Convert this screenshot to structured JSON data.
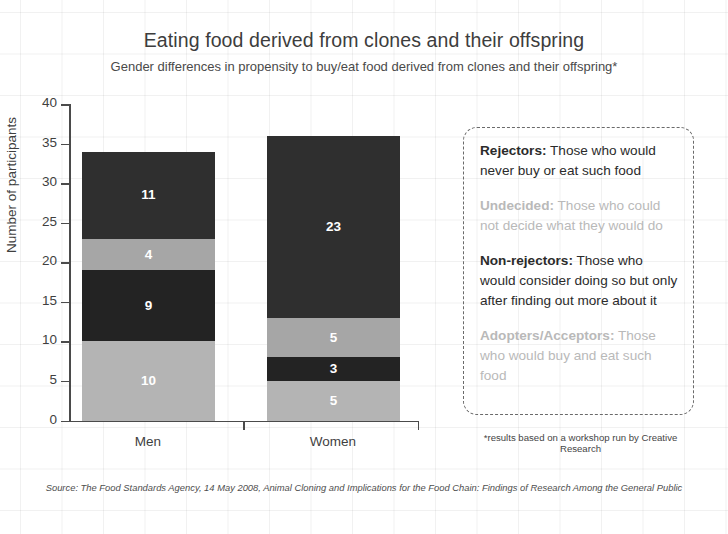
{
  "chart_data": {
    "type": "bar",
    "subtype": "stacked-bar",
    "title": "Eating food derived from clones and their offspring",
    "subtitle": "Gender differences in propensity to buy/eat food derived from clones and their offspring*",
    "xlabel": "",
    "ylabel": "Number of participants",
    "ylim": [
      0,
      40
    ],
    "yticks": [
      0,
      5,
      10,
      15,
      20,
      25,
      30,
      35,
      40
    ],
    "ytick_labels": [
      "0",
      "5",
      "10",
      "15",
      "20",
      "25",
      "30",
      "35",
      "40"
    ],
    "grid": false,
    "legend_position": "right",
    "categories": [
      "Men",
      "Women"
    ],
    "stack_order": "bottom-to-top",
    "series": [
      {
        "name": "Adopters/Acceptors",
        "values": [
          10,
          5
        ],
        "color": "#b4b4b4"
      },
      {
        "name": "Non-rejectors",
        "values": [
          9,
          3
        ],
        "color": "#232323"
      },
      {
        "name": "Undecided",
        "values": [
          4,
          5
        ],
        "color": "#a6a6a6"
      },
      {
        "name": "Rejectors",
        "values": [
          11,
          23
        ],
        "color": "#2f2f2f"
      }
    ],
    "totals": [
      34,
      36
    ]
  },
  "titles": {
    "main": "Eating food derived from clones and their offspring",
    "sub": "Gender differences in propensity to buy/eat food derived from clones and their offspring*"
  },
  "axes": {
    "y_title": "Number of participants",
    "y_ticks": [
      "40",
      "35",
      "30",
      "25",
      "20",
      "15",
      "10",
      "5",
      "0"
    ],
    "x_categories": [
      "Men",
      "Women"
    ]
  },
  "bars": {
    "men": {
      "label": "Men",
      "total": 34,
      "segments": [
        {
          "name": "Adopters/Acceptors",
          "value": "10",
          "color": "#b4b4b4"
        },
        {
          "name": "Non-rejectors",
          "value": "9",
          "color": "#232323"
        },
        {
          "name": "Undecided",
          "value": "4",
          "color": "#a6a6a6"
        },
        {
          "name": "Rejectors",
          "value": "11",
          "color": "#2f2f2f"
        }
      ]
    },
    "women": {
      "label": "Women",
      "total": 36,
      "segments": [
        {
          "name": "Adopters/Acceptors",
          "value": "5",
          "color": "#b4b4b4"
        },
        {
          "name": "Non-rejectors",
          "value": "3",
          "color": "#232323"
        },
        {
          "name": "Undecided",
          "value": "5",
          "color": "#a6a6a6"
        },
        {
          "name": "Rejectors",
          "value": "23",
          "color": "#2f2f2f"
        }
      ]
    }
  },
  "legend": {
    "entries": [
      {
        "term": "Rejectors:",
        "description": " Those who would never buy or eat such food",
        "tone": "dark"
      },
      {
        "term": "Undecided:",
        "description": " Those who could not decide what they would do",
        "tone": "light"
      },
      {
        "term": "Non-rejectors:",
        "description": " Those who would consider doing so but only after finding out more about it",
        "tone": "dark"
      },
      {
        "term": "Adopters/Acceptors:",
        "description": " Those who would buy and eat such food",
        "tone": "light"
      }
    ]
  },
  "notes": {
    "footnote": "*results based on a workshop run by Creative Research",
    "source": "Source: The Food Standards Agency, 14 May 2008, Animal Cloning and Implications for the Food Chain: Findings of Research Among the General Public"
  }
}
